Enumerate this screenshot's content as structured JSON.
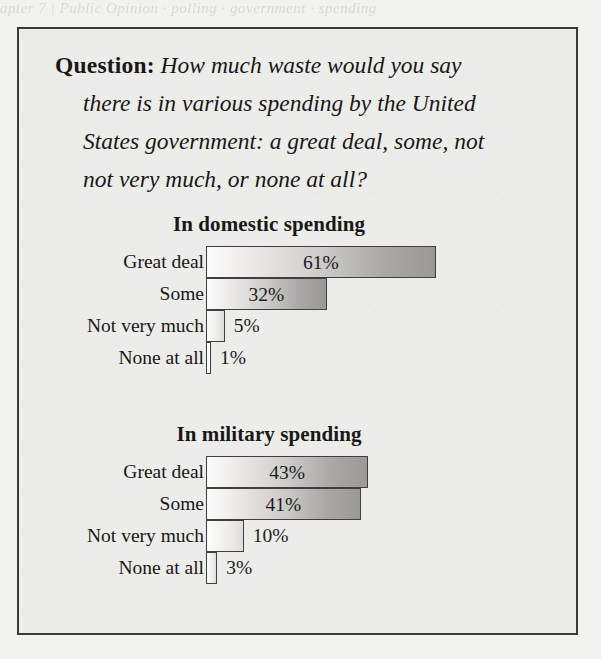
{
  "page": {
    "bleed_text": "apter 7 | Public Opinion  ·  polling  ·  government  ·  spending"
  },
  "question": {
    "label": "Question:",
    "lines": [
      "How much waste would you say",
      "there is in various spending by the United",
      "States government: a great deal, some, not",
      "not very much, or none at all?"
    ]
  },
  "chart_data": [
    {
      "type": "bar",
      "orientation": "horizontal",
      "title": "In domestic spending",
      "xlabel": "",
      "ylabel": "",
      "xlim": [
        0,
        65
      ],
      "grid": false,
      "legend": false,
      "categories": [
        "Great deal",
        "Some",
        "Not very much",
        "None at all"
      ],
      "values": [
        61,
        32,
        5,
        1
      ],
      "value_labels": [
        "61%",
        "32%",
        "5%",
        "1%"
      ],
      "label_placement": [
        "inside",
        "inside",
        "outside",
        "outside"
      ]
    },
    {
      "type": "bar",
      "orientation": "horizontal",
      "title": "In military spending",
      "xlabel": "",
      "ylabel": "",
      "xlim": [
        0,
        65
      ],
      "grid": false,
      "legend": false,
      "categories": [
        "Great deal",
        "Some",
        "Not very much",
        "None at all"
      ],
      "values": [
        43,
        41,
        10,
        3
      ],
      "value_labels": [
        "43%",
        "41%",
        "10%",
        "3%"
      ],
      "label_placement": [
        "inside",
        "inside",
        "outside",
        "outside"
      ]
    }
  ],
  "style": {
    "px_per_percent": 3.77,
    "frame_border_color": "#3a3a3c",
    "panel_background": "#ecece8",
    "page_background": "#f2f2ee",
    "bar_border_color": "#3f3f41",
    "bar_gradient_start": "#fbfbfa",
    "bar_gradient_end": "#9a9996",
    "text_color": "#181818"
  }
}
